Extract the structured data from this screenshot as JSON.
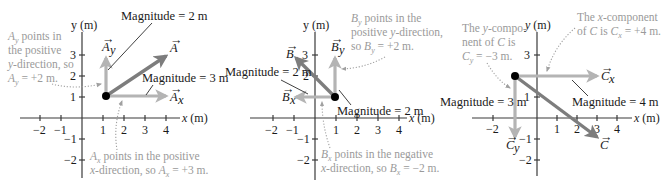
{
  "colors": {
    "resultant": "#7d7d7d",
    "component": "#b4b4b4",
    "axis": "#3a3a3a",
    "note_text": "#9a9a9a",
    "label_text": "#1a1a1a",
    "point": "#000000"
  },
  "panels": [
    {
      "id": "A",
      "axis_x_label": "x (m)",
      "axis_y_label": "y (m)",
      "x_ticks": [
        "−2",
        "−1",
        "1",
        "2",
        "3",
        "4"
      ],
      "y_ticks": [
        "3",
        "2",
        "1",
        "−1",
        "−2"
      ],
      "vector_label": "A",
      "comp_x_label": "A",
      "comp_x_sub": "x",
      "comp_y_label": "A",
      "comp_y_sub": "y",
      "magnitude_y": "Magnitude = 2 m",
      "magnitude_x": "Magnitude = 3 m",
      "note_y": [
        "A",
        "y",
        " points in",
        "the positive",
        "y-direction, so",
        "A",
        "y",
        " = +2 m."
      ],
      "note_y_lines": [
        "ₓ points in",
        "the positive",
        "y-direction, so",
        "= +2 m."
      ],
      "note_x_lines": [
        "points in the positive",
        "x-direction, so",
        "= +3 m."
      ],
      "start": [
        1,
        1
      ],
      "end": [
        4,
        3
      ]
    },
    {
      "id": "B",
      "axis_x_label": "x (m)",
      "axis_y_label": "y (m)",
      "x_ticks": [
        "−2",
        "−1",
        "1",
        "2",
        "3",
        "4"
      ],
      "y_ticks": [
        "3",
        "2",
        "−1",
        "−2"
      ],
      "vector_label": "B",
      "comp_x_label": "B",
      "comp_x_sub": "x",
      "comp_y_label": "B",
      "comp_y_sub": "y",
      "magnitude_x": "Magnitude = 2 m",
      "magnitude_y": "Magnitude = 2 m",
      "note_y_lines": [
        "points in the",
        "positive y-direction,",
        "so",
        "= +2 m."
      ],
      "note_x_lines": [
        "points in the negative",
        "x-direction, so",
        "= −2 m."
      ],
      "start": [
        1,
        1
      ],
      "end": [
        -1,
        3
      ]
    },
    {
      "id": "C",
      "axis_x_label": "x (m)",
      "axis_y_label": "y (m)",
      "x_ticks": [
        "−2",
        "1",
        "2",
        "3",
        "4"
      ],
      "y_ticks": [
        "3",
        "1",
        "−1",
        "−2"
      ],
      "vector_label": "C",
      "comp_x_label": "C",
      "comp_x_sub": "x",
      "comp_y_label": "C",
      "comp_y_sub": "y",
      "magnitude_y": "Magnitude = 3 m",
      "magnitude_x": "Magnitude = 4 m",
      "note_y_lines": [
        "The y-compo-",
        "nent of",
        "is",
        "= −3 m."
      ],
      "note_x_lines": [
        "The x-component",
        "of",
        "is",
        "= +4 m."
      ],
      "start": [
        -1,
        2
      ],
      "end": [
        3,
        -1
      ]
    }
  ]
}
